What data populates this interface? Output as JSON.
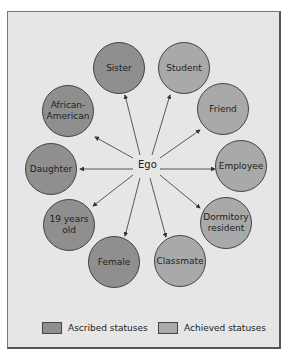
{
  "diagram": {
    "center": "Ego",
    "nodes": [
      {
        "label": "Sister",
        "type": "ascribed"
      },
      {
        "label": "Student",
        "type": "achieved"
      },
      {
        "label": "African-\nAmerican",
        "type": "ascribed"
      },
      {
        "label": "Friend",
        "type": "achieved"
      },
      {
        "label": "Daughter",
        "type": "ascribed"
      },
      {
        "label": "Employee",
        "type": "achieved"
      },
      {
        "label": "19 years old",
        "type": "ascribed"
      },
      {
        "label": "Dormitory resident",
        "type": "achieved"
      },
      {
        "label": "Female",
        "type": "ascribed"
      },
      {
        "label": "Classmate",
        "type": "achieved"
      }
    ]
  },
  "legend": {
    "ascribed": "Ascribed statuses",
    "achieved": "Achieved statuses"
  },
  "colors": {
    "ascribed": "#8f8f8f",
    "achieved": "#a9a9a9",
    "background": "#e6e6e6"
  }
}
